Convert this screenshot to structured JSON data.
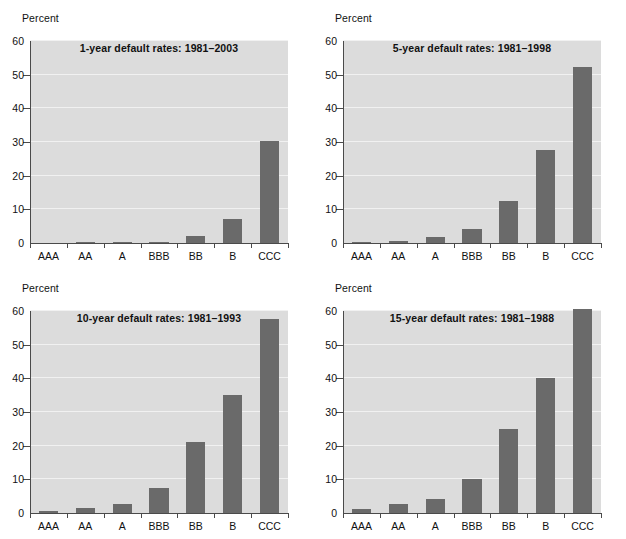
{
  "figure": {
    "ylabel": "Percent",
    "categories": [
      "AAA",
      "AA",
      "A",
      "BBB",
      "BB",
      "B",
      "CCC"
    ],
    "yticks": [
      0,
      10,
      20,
      30,
      40,
      50,
      60
    ],
    "ytick_labels": [
      "0",
      "10",
      "20",
      "30",
      "40",
      "50",
      "60"
    ],
    "ylim": [
      0,
      60
    ],
    "bar_color": "#6a6a6a",
    "plot_background": "#dcdcdc",
    "gridline_color": "#f1f1f1"
  },
  "chart_data": [
    {
      "type": "bar",
      "title": "1-year default rates: 1981–2003",
      "xlabel": "",
      "ylabel": "Percent",
      "categories": [
        "AAA",
        "AA",
        "A",
        "BBB",
        "BB",
        "B",
        "CCC"
      ],
      "values": [
        0.0,
        0.02,
        0.3,
        0.4,
        2.1,
        7.2,
        30.3
      ],
      "ylim": [
        0,
        60
      ],
      "yticks": [
        0,
        10,
        20,
        30,
        40,
        50,
        60
      ],
      "grid": true,
      "legend": "none"
    },
    {
      "type": "bar",
      "title": "5-year default rates: 1981–1998",
      "xlabel": "",
      "ylabel": "Percent",
      "categories": [
        "AAA",
        "AA",
        "A",
        "BBB",
        "BB",
        "B",
        "CCC"
      ],
      "values": [
        0.1,
        0.6,
        1.7,
        4.3,
        12.4,
        27.5,
        52.4
      ],
      "ylim": [
        0,
        60
      ],
      "yticks": [
        0,
        10,
        20,
        30,
        40,
        50,
        60
      ],
      "grid": true,
      "legend": "none"
    },
    {
      "type": "bar",
      "title": "10-year default rates: 1981–1993",
      "xlabel": "",
      "ylabel": "Percent",
      "categories": [
        "AAA",
        "AA",
        "A",
        "BBB",
        "BB",
        "B",
        "CCC"
      ],
      "values": [
        0.7,
        1.6,
        2.8,
        7.4,
        21.2,
        35.2,
        57.5
      ],
      "ylim": [
        0,
        60
      ],
      "yticks": [
        0,
        10,
        20,
        30,
        40,
        50,
        60
      ],
      "grid": true,
      "legend": "none"
    },
    {
      "type": "bar",
      "title": "15-year default rates: 1981–1988",
      "xlabel": "",
      "ylabel": "Percent",
      "categories": [
        "AAA",
        "AA",
        "A",
        "BBB",
        "BB",
        "B",
        "CCC"
      ],
      "values": [
        1.2,
        2.7,
        4.2,
        10.1,
        25.1,
        40.1,
        60.5
      ],
      "ylim": [
        0,
        60
      ],
      "yticks": [
        0,
        10,
        20,
        30,
        40,
        50,
        60
      ],
      "grid": true,
      "legend": "none"
    }
  ]
}
